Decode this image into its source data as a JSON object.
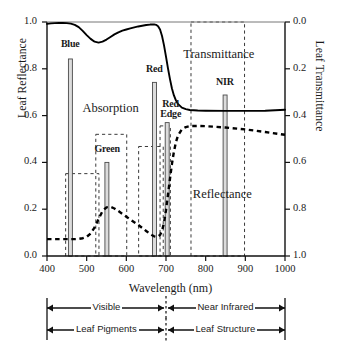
{
  "chart_data": {
    "type": "line",
    "title": "",
    "xlabel": "Wavelength (nm)",
    "ylabel": "Leaf Reflectance",
    "y2label": "Leaf Transmittance",
    "xlim": [
      400,
      1000
    ],
    "ylim": [
      0.0,
      1.0
    ],
    "y2lim": [
      1.0,
      0.0
    ],
    "grid": false,
    "xticks": [
      400,
      500,
      600,
      700,
      800,
      900,
      1000
    ],
    "xticklabels": [
      "400",
      "500",
      "600",
      "700",
      "800",
      "900",
      "1000"
    ],
    "yticks": [
      0.0,
      0.2,
      0.4,
      0.6,
      0.8,
      1.0
    ],
    "yticklabels": [
      "0.0",
      "0.2",
      "0.4",
      "0.6",
      "0.8",
      "1.0"
    ],
    "y2ticks": [
      0.0,
      0.2,
      0.4,
      0.6,
      0.8,
      1.0
    ],
    "y2ticklabels": [
      "0.0",
      "0.2",
      "0.4",
      "0.6",
      "0.8",
      "1.0"
    ],
    "series": [
      {
        "name": "Transmittance",
        "style": "solid",
        "axis": "left",
        "x": [
          400,
          410,
          420,
          430,
          440,
          450,
          460,
          470,
          480,
          490,
          500,
          510,
          520,
          530,
          540,
          550,
          560,
          570,
          580,
          590,
          600,
          610,
          620,
          630,
          640,
          650,
          660,
          670,
          675,
          680,
          685,
          690,
          695,
          700,
          705,
          710,
          715,
          720,
          725,
          730,
          740,
          750,
          760,
          780,
          800,
          850,
          900,
          950,
          1000
        ],
        "values": [
          0.992,
          0.994,
          0.995,
          0.996,
          0.996,
          0.995,
          0.993,
          0.988,
          0.978,
          0.962,
          0.944,
          0.928,
          0.916,
          0.912,
          0.916,
          0.925,
          0.936,
          0.947,
          0.956,
          0.963,
          0.968,
          0.973,
          0.977,
          0.981,
          0.984,
          0.987,
          0.989,
          0.99,
          0.988,
          0.982,
          0.968,
          0.94,
          0.9,
          0.852,
          0.802,
          0.756,
          0.716,
          0.686,
          0.665,
          0.65,
          0.634,
          0.628,
          0.624,
          0.622,
          0.621,
          0.62,
          0.62,
          0.621,
          0.625
        ]
      },
      {
        "name": "Reflectance",
        "style": "dashed",
        "axis": "left",
        "x": [
          400,
          410,
          420,
          430,
          440,
          450,
          460,
          470,
          480,
          490,
          500,
          510,
          520,
          530,
          540,
          550,
          560,
          570,
          580,
          590,
          600,
          610,
          620,
          630,
          640,
          650,
          660,
          670,
          675,
          680,
          685,
          690,
          695,
          700,
          705,
          710,
          715,
          720,
          725,
          730,
          740,
          750,
          760,
          780,
          800,
          850,
          900,
          950,
          1000
        ],
        "values": [
          0.072,
          0.072,
          0.072,
          0.072,
          0.072,
          0.072,
          0.072,
          0.072,
          0.073,
          0.076,
          0.082,
          0.096,
          0.122,
          0.158,
          0.192,
          0.208,
          0.21,
          0.203,
          0.192,
          0.18,
          0.168,
          0.156,
          0.144,
          0.133,
          0.12,
          0.107,
          0.094,
          0.084,
          0.082,
          0.083,
          0.09,
          0.108,
          0.142,
          0.196,
          0.262,
          0.33,
          0.394,
          0.446,
          0.486,
          0.514,
          0.542,
          0.551,
          0.555,
          0.556,
          0.555,
          0.549,
          0.541,
          0.53,
          0.518
        ]
      }
    ],
    "bars": [
      {
        "label": "Blue",
        "center": 459,
        "width": 10,
        "value": 0.842,
        "label_x": 459,
        "label_y": 0.9
      },
      {
        "label": "Green",
        "center": 551,
        "width": 10,
        "value": 0.4,
        "label_x": 551,
        "label_y": 0.455
      },
      {
        "label": "Red",
        "center": 671,
        "width": 10,
        "value": 0.742,
        "label_x": 671,
        "label_y": 0.795
      },
      {
        "label": "Red Edge",
        "center": 703,
        "width": 10,
        "value": 0.57,
        "label_x": 712,
        "label_y": 0.645
      },
      {
        "label": "NIR",
        "center": 849,
        "width": 10,
        "value": 0.688,
        "label_x": 849,
        "label_y": 0.74
      }
    ],
    "band_boxes": [
      {
        "x0": 447,
        "x1": 531,
        "y0": 0.0,
        "y1": 0.352
      },
      {
        "x0": 523,
        "x1": 601,
        "y0": 0.0,
        "y1": 0.52
      },
      {
        "x0": 631,
        "x1": 693,
        "y0": 0.0,
        "y1": 0.468
      },
      {
        "x0": 685,
        "x1": 711,
        "y0": 0.0,
        "y1": 0.556
      },
      {
        "x0": 763,
        "x1": 898,
        "y0": 0.0,
        "y1": 1.0
      }
    ],
    "annotations": [
      {
        "text": "Absorption",
        "x": 560,
        "y": 0.625
      },
      {
        "text": "Transmittance",
        "x": 833,
        "y": 0.855
      },
      {
        "text": "Reflectance",
        "x": 842,
        "y": 0.255
      }
    ],
    "range_bars": [
      {
        "left_label": "Visible",
        "right_label": "Near Infrared",
        "split": 700
      },
      {
        "left_label": "Leaf Pigments",
        "right_label": "Leaf Structure",
        "split": 700
      }
    ]
  }
}
